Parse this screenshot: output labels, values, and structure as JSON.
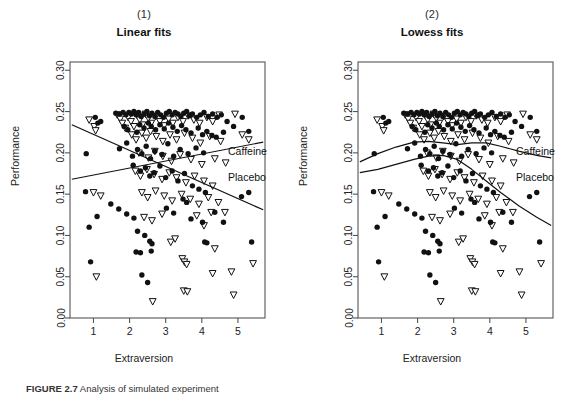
{
  "figure": {
    "caption_label": "FIGURE 2.7",
    "caption_text": " Analysis of simulated experiment",
    "xlabel": "Extraversion",
    "ylabel": "Performance"
  },
  "panels": [
    {
      "number": "(1)",
      "title": "Linear fits",
      "series_labels": {
        "caffeine": "Caffeine",
        "placebo": "Placebo"
      }
    },
    {
      "number": "(2)",
      "title": "Lowess fits",
      "series_labels": {
        "caffeine": "Caffeine",
        "placebo": "Placebo"
      }
    }
  ],
  "chart_data": {
    "type": "scatter",
    "title": "Analysis of simulated experiment",
    "xlabel": "Extraversion",
    "ylabel": "Performance",
    "xlim": [
      0.35,
      5.75
    ],
    "ylim": [
      0.0,
      0.31
    ],
    "xticks": [
      1,
      2,
      3,
      4,
      5
    ],
    "yticks": [
      0.0,
      0.05,
      0.1,
      0.15,
      0.2,
      0.25,
      0.3
    ],
    "ytick_labels": [
      "0.00",
      "0.05",
      "0.10",
      "0.15",
      "0.20",
      "0.25",
      "0.30"
    ],
    "grid": false,
    "legend_position": "inline-right",
    "series": [
      {
        "name": "Caffeine",
        "marker": "filled-circle",
        "points": [
          [
            1.05,
            0.243
          ],
          [
            1.2,
            0.238
          ],
          [
            1.12,
            0.236
          ],
          [
            0.8,
            0.199
          ],
          [
            0.78,
            0.153
          ],
          [
            0.88,
            0.11
          ],
          [
            0.92,
            0.068
          ],
          [
            1.1,
            0.123
          ],
          [
            1.62,
            0.248
          ],
          [
            1.72,
            0.247
          ],
          [
            1.82,
            0.249
          ],
          [
            1.9,
            0.246
          ],
          [
            1.98,
            0.249
          ],
          [
            2.05,
            0.247
          ],
          [
            2.12,
            0.25
          ],
          [
            2.18,
            0.246
          ],
          [
            2.25,
            0.249
          ],
          [
            2.32,
            0.244
          ],
          [
            2.4,
            0.247
          ],
          [
            2.48,
            0.25
          ],
          [
            2.55,
            0.245
          ],
          [
            2.62,
            0.248
          ],
          [
            2.7,
            0.244
          ],
          [
            2.78,
            0.249
          ],
          [
            2.86,
            0.246
          ],
          [
            2.94,
            0.243
          ],
          [
            3.02,
            0.248
          ],
          [
            3.1,
            0.25
          ],
          [
            3.18,
            0.246
          ],
          [
            3.26,
            0.249
          ],
          [
            3.34,
            0.247
          ],
          [
            3.42,
            0.244
          ],
          [
            3.5,
            0.248
          ],
          [
            3.58,
            0.25
          ],
          [
            3.66,
            0.245
          ],
          [
            3.74,
            0.247
          ],
          [
            3.86,
            0.243
          ],
          [
            3.96,
            0.246
          ],
          [
            4.06,
            0.249
          ],
          [
            4.18,
            0.244
          ],
          [
            4.3,
            0.247
          ],
          [
            4.42,
            0.243
          ],
          [
            4.54,
            0.246
          ],
          [
            4.7,
            0.238
          ],
          [
            4.88,
            0.232
          ],
          [
            5.12,
            0.243
          ],
          [
            5.3,
            0.226
          ],
          [
            1.85,
            0.232
          ],
          [
            1.95,
            0.228
          ],
          [
            2.2,
            0.225
          ],
          [
            2.28,
            0.234
          ],
          [
            2.4,
            0.23
          ],
          [
            2.52,
            0.236
          ],
          [
            2.6,
            0.232
          ],
          [
            2.72,
            0.228
          ],
          [
            2.84,
            0.234
          ],
          [
            2.96,
            0.229
          ],
          [
            3.08,
            0.236
          ],
          [
            3.2,
            0.231
          ],
          [
            3.32,
            0.226
          ],
          [
            3.44,
            0.233
          ],
          [
            3.56,
            0.228
          ],
          [
            3.7,
            0.224
          ],
          [
            3.9,
            0.23
          ],
          [
            4.02,
            0.222
          ],
          [
            4.14,
            0.226
          ],
          [
            4.28,
            0.221
          ],
          [
            4.4,
            0.219
          ],
          [
            4.6,
            0.225
          ],
          [
            1.72,
            0.205
          ],
          [
            1.92,
            0.212
          ],
          [
            2.08,
            0.196
          ],
          [
            2.22,
            0.204
          ],
          [
            2.34,
            0.199
          ],
          [
            2.46,
            0.208
          ],
          [
            2.58,
            0.193
          ],
          [
            2.7,
            0.202
          ],
          [
            2.9,
            0.198
          ],
          [
            3.06,
            0.211
          ],
          [
            3.22,
            0.196
          ],
          [
            3.4,
            0.204
          ],
          [
            3.62,
            0.199
          ],
          [
            3.84,
            0.206
          ],
          [
            4.05,
            0.2
          ],
          [
            2.1,
            0.185
          ],
          [
            2.3,
            0.178
          ],
          [
            2.44,
            0.182
          ],
          [
            2.56,
            0.172
          ],
          [
            2.68,
            0.176
          ],
          [
            2.84,
            0.184
          ],
          [
            3.0,
            0.17
          ],
          [
            3.18,
            0.178
          ],
          [
            3.34,
            0.166
          ],
          [
            3.52,
            0.175
          ],
          [
            3.74,
            0.16
          ],
          [
            3.92,
            0.156
          ],
          [
            4.1,
            0.152
          ],
          [
            1.48,
            0.138
          ],
          [
            1.7,
            0.132
          ],
          [
            1.92,
            0.126
          ],
          [
            2.12,
            0.121
          ],
          [
            2.22,
            0.105
          ],
          [
            2.42,
            0.1
          ],
          [
            2.3,
            0.079
          ],
          [
            2.56,
            0.093
          ],
          [
            2.62,
            0.09
          ],
          [
            2.6,
            0.081
          ],
          [
            2.34,
            0.052
          ],
          [
            2.5,
            0.043
          ],
          [
            2.18,
            0.08
          ],
          [
            3.02,
            0.133
          ],
          [
            3.22,
            0.127
          ],
          [
            3.48,
            0.144
          ],
          [
            3.58,
            0.14
          ],
          [
            3.7,
            0.12
          ],
          [
            4.02,
            0.116
          ],
          [
            4.08,
            0.092
          ],
          [
            4.14,
            0.091
          ],
          [
            4.36,
            0.128
          ],
          [
            4.6,
            0.116
          ],
          [
            5.38,
            0.092
          ],
          [
            5.1,
            0.147
          ],
          [
            5.3,
            0.152
          ]
        ]
      },
      {
        "name": "Placebo",
        "marker": "open-triangle-down",
        "points": [
          [
            0.88,
            0.24
          ],
          [
            1.02,
            0.232
          ],
          [
            1.06,
            0.227
          ],
          [
            1.0,
            0.152
          ],
          [
            1.08,
            0.05
          ],
          [
            1.2,
            0.148
          ],
          [
            1.66,
            0.246
          ],
          [
            1.74,
            0.241
          ],
          [
            1.8,
            0.236
          ],
          [
            1.88,
            0.23
          ],
          [
            1.96,
            0.243
          ],
          [
            2.04,
            0.238
          ],
          [
            2.12,
            0.232
          ],
          [
            2.2,
            0.246
          ],
          [
            2.28,
            0.24
          ],
          [
            2.36,
            0.234
          ],
          [
            2.44,
            0.247
          ],
          [
            2.52,
            0.242
          ],
          [
            2.6,
            0.236
          ],
          [
            2.72,
            0.244
          ],
          [
            2.84,
            0.238
          ],
          [
            2.96,
            0.233
          ],
          [
            3.08,
            0.241
          ],
          [
            3.2,
            0.236
          ],
          [
            3.34,
            0.243
          ],
          [
            3.48,
            0.238
          ],
          [
            3.62,
            0.245
          ],
          [
            3.78,
            0.24
          ],
          [
            3.94,
            0.236
          ],
          [
            4.14,
            0.243
          ],
          [
            4.3,
            0.238
          ],
          [
            4.48,
            0.246
          ],
          [
            4.92,
            0.247
          ],
          [
            2.06,
            0.222
          ],
          [
            2.18,
            0.216
          ],
          [
            2.34,
            0.224
          ],
          [
            2.46,
            0.218
          ],
          [
            2.58,
            0.226
          ],
          [
            2.74,
            0.22
          ],
          [
            2.92,
            0.214
          ],
          [
            3.12,
            0.222
          ],
          [
            3.3,
            0.216
          ],
          [
            3.52,
            0.224
          ],
          [
            3.74,
            0.218
          ],
          [
            3.96,
            0.212
          ],
          [
            4.22,
            0.22
          ],
          [
            4.52,
            0.214
          ],
          [
            5.12,
            0.222
          ],
          [
            5.3,
            0.216
          ],
          [
            2.26,
            0.2
          ],
          [
            2.52,
            0.194
          ],
          [
            2.7,
            0.202
          ],
          [
            2.92,
            0.196
          ],
          [
            3.16,
            0.19
          ],
          [
            3.4,
            0.198
          ],
          [
            3.7,
            0.192
          ],
          [
            4.0,
            0.186
          ],
          [
            4.36,
            0.193
          ],
          [
            4.66,
            0.188
          ],
          [
            2.16,
            0.178
          ],
          [
            2.3,
            0.172
          ],
          [
            2.48,
            0.18
          ],
          [
            2.68,
            0.174
          ],
          [
            2.9,
            0.168
          ],
          [
            3.1,
            0.176
          ],
          [
            3.3,
            0.17
          ],
          [
            3.56,
            0.164
          ],
          [
            3.8,
            0.172
          ],
          [
            4.06,
            0.166
          ],
          [
            4.3,
            0.16
          ],
          [
            2.34,
            0.152
          ],
          [
            2.5,
            0.146
          ],
          [
            2.72,
            0.154
          ],
          [
            2.96,
            0.148
          ],
          [
            3.18,
            0.142
          ],
          [
            3.44,
            0.15
          ],
          [
            3.68,
            0.144
          ],
          [
            3.92,
            0.138
          ],
          [
            4.18,
            0.146
          ],
          [
            4.46,
            0.14
          ],
          [
            2.4,
            0.122
          ],
          [
            2.62,
            0.118
          ],
          [
            2.9,
            0.126
          ],
          [
            3.14,
            0.092
          ],
          [
            3.26,
            0.096
          ],
          [
            3.46,
            0.072
          ],
          [
            3.52,
            0.068
          ],
          [
            3.58,
            0.065
          ],
          [
            3.5,
            0.033
          ],
          [
            3.6,
            0.032
          ],
          [
            2.64,
            0.02
          ],
          [
            3.86,
            0.124
          ],
          [
            4.06,
            0.112
          ],
          [
            4.26,
            0.128
          ],
          [
            4.36,
            0.084
          ],
          [
            4.3,
            0.054
          ],
          [
            4.64,
            0.128
          ],
          [
            4.82,
            0.056
          ],
          [
            4.88,
            0.028
          ],
          [
            5.42,
            0.066
          ]
        ]
      }
    ],
    "linear_fits": [
      {
        "name": "Caffeine",
        "x": [
          0.4,
          5.7
        ],
        "y": [
          0.168,
          0.213
        ]
      },
      {
        "name": "Placebo",
        "x": [
          0.4,
          5.7
        ],
        "y": [
          0.234,
          0.131
        ]
      }
    ],
    "lowess_fits": [
      {
        "name": "Caffeine",
        "x": [
          0.4,
          0.9,
          1.4,
          1.9,
          2.3,
          2.7,
          3.1,
          3.5,
          3.9,
          4.3,
          4.8,
          5.3,
          5.7
        ],
        "y": [
          0.189,
          0.199,
          0.207,
          0.213,
          0.214,
          0.212,
          0.21,
          0.212,
          0.212,
          0.208,
          0.202,
          0.197,
          0.194
        ]
      },
      {
        "name": "Placebo",
        "x": [
          0.4,
          0.9,
          1.4,
          1.9,
          2.3,
          2.7,
          3.1,
          3.5,
          3.9,
          4.3,
          4.8,
          5.3,
          5.7
        ],
        "y": [
          0.176,
          0.18,
          0.186,
          0.192,
          0.196,
          0.197,
          0.192,
          0.18,
          0.166,
          0.152,
          0.136,
          0.122,
          0.112
        ]
      }
    ]
  }
}
